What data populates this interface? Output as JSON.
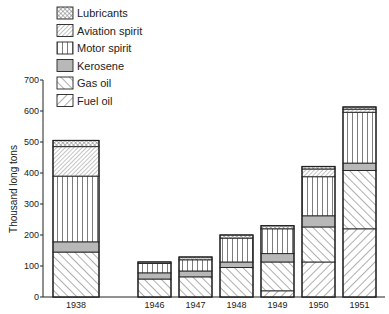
{
  "chart_data": {
    "type": "bar",
    "stacked": true,
    "title": "",
    "xlabel": "",
    "ylabel": "Thousand long tons",
    "ylim": [
      0,
      700
    ],
    "yticks": [
      0,
      100,
      200,
      300,
      400,
      500,
      600,
      700
    ],
    "grid": false,
    "legend_position": "top-left",
    "categories": [
      "1938",
      "1946",
      "1947",
      "1948",
      "1949",
      "1950",
      "1951"
    ],
    "series": [
      {
        "name": "Fuel oil",
        "pattern": "hatch-forward",
        "values": [
          0,
          0,
          0,
          0,
          20,
          113,
          220
        ]
      },
      {
        "name": "Gas oil",
        "pattern": "hatch-backward",
        "values": [
          145,
          58,
          65,
          95,
          93,
          113,
          188
        ]
      },
      {
        "name": "Kerosene",
        "pattern": "solid-grey",
        "values": [
          33,
          20,
          19,
          18,
          27,
          36,
          24
        ]
      },
      {
        "name": "Motor spirit",
        "pattern": "vertical-lines",
        "values": [
          212,
          30,
          36,
          77,
          80,
          126,
          164
        ]
      },
      {
        "name": "Aviation spirit",
        "pattern": "hatch-fine-forward",
        "values": [
          95,
          0,
          0,
          0,
          0,
          25,
          10
        ]
      },
      {
        "name": "Lubricants",
        "pattern": "cross-hatch",
        "values": [
          20,
          5,
          9,
          10,
          10,
          8,
          7
        ]
      }
    ],
    "totals": [
      505,
      113,
      129,
      200,
      230,
      421,
      613
    ]
  },
  "legend": {
    "items": [
      {
        "label": "Lubricants",
        "pattern": "cross-hatch"
      },
      {
        "label": "Aviation spirit",
        "pattern": "hatch-fine-forward"
      },
      {
        "label": "Motor spirit",
        "pattern": "vertical-lines"
      },
      {
        "label": "Kerosene",
        "pattern": "solid-grey"
      },
      {
        "label": "Gas oil",
        "pattern": "hatch-backward"
      },
      {
        "label": "Fuel oil",
        "pattern": "hatch-forward"
      }
    ]
  },
  "colors": {
    "ink": "#222222",
    "kerosene_fill": "#b8b8b8",
    "background": "#ffffff"
  }
}
